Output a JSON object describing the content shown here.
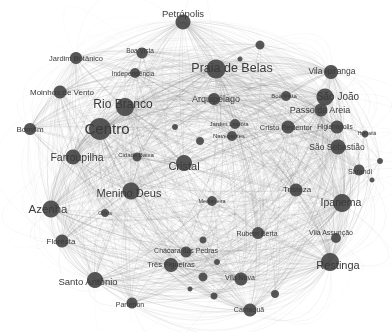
{
  "figure": {
    "title": "",
    "width": 392,
    "height": 332,
    "background_color": "#ffffff"
  },
  "chart_data": {
    "type": "network",
    "title": "",
    "subtitle": "",
    "xlabel": "",
    "ylabel": "",
    "grid": false,
    "legend": "none",
    "layout": "force-directed",
    "node_color": "#4a4a4a",
    "edge_color": "#808080",
    "label_color": "#3a3a3a",
    "node_count": 52,
    "nodes": [
      {
        "id": "petropolis",
        "label": "Petrópolis",
        "x": 183,
        "y": 22,
        "r": 7.5,
        "font": 9.5,
        "lx": 183,
        "ly": 13
      },
      {
        "id": "jardim-botanico",
        "label": "Jardim Botânico",
        "x": 76,
        "y": 58,
        "r": 6.0,
        "font": 7.5,
        "lx": 76,
        "ly": 58
      },
      {
        "id": "boa-vista-n",
        "label": "Boa Vista",
        "x": 142,
        "y": 53,
        "r": 5.5,
        "font": 6.5,
        "lx": 140,
        "ly": 50
      },
      {
        "id": "independencia",
        "label": "Independência",
        "x": 135,
        "y": 73,
        "r": 5.0,
        "font": 6.5,
        "lx": 133,
        "ly": 73
      },
      {
        "id": "praia-de-belas",
        "label": "Praia de Belas",
        "x": 216,
        "y": 69,
        "r": 9.5,
        "font": 12.5,
        "lx": 232,
        "ly": 68
      },
      {
        "id": "vila-ipiranga",
        "label": "Vila Ipiranga",
        "x": 331,
        "y": 72,
        "r": 7.0,
        "font": 8.5,
        "lx": 332,
        "ly": 71
      },
      {
        "id": "moinhos-de-vento",
        "label": "Moinhos de Vento",
        "x": 60,
        "y": 92,
        "r": 6.5,
        "font": 8.0,
        "lx": 62,
        "ly": 92
      },
      {
        "id": "rio-branco",
        "label": "Rio Branco",
        "x": 125,
        "y": 107,
        "r": 9.0,
        "font": 12.0,
        "lx": 123,
        "ly": 104
      },
      {
        "id": "arquipelago",
        "label": "Arquipélago",
        "x": 214,
        "y": 99,
        "r": 6.0,
        "font": 9.0,
        "lx": 216,
        "ly": 99
      },
      {
        "id": "sao-joao",
        "label": "São João",
        "x": 325,
        "y": 97,
        "r": 8.5,
        "font": 10.0,
        "lx": 338,
        "ly": 96
      },
      {
        "id": "boa-vista-e",
        "label": "Boa Vista",
        "x": 286,
        "y": 96,
        "r": 5.0,
        "font": 6.0,
        "lx": 284,
        "ly": 96
      },
      {
        "id": "passo-da-areia",
        "label": "Passo da Areia",
        "x": 321,
        "y": 110,
        "r": 6.5,
        "font": 9.0,
        "lx": 320,
        "ly": 110
      },
      {
        "id": "bomfim",
        "label": "Bomfim",
        "x": 30,
        "y": 129,
        "r": 6.0,
        "font": 8.0,
        "lx": 30,
        "ly": 129
      },
      {
        "id": "centro",
        "label": "Centro",
        "x": 100,
        "y": 129,
        "r": 11.0,
        "font": 15.0,
        "lx": 107,
        "ly": 128
      },
      {
        "id": "jardim-lindoia",
        "label": "Jardim Lindóia",
        "x": 235,
        "y": 124,
        "r": 5.0,
        "font": 6.0,
        "lx": 229,
        "ly": 124
      },
      {
        "id": "cristo-redentor",
        "label": "Cristo Redentor",
        "x": 288,
        "y": 127,
        "r": 6.5,
        "font": 7.5,
        "lx": 286,
        "ly": 127
      },
      {
        "id": "higienopolis",
        "label": "Higienópolis",
        "x": 337,
        "y": 127,
        "r": 6.5,
        "font": 6.5,
        "lx": 335,
        "ly": 126
      },
      {
        "id": "navegantes",
        "label": "Navegantes",
        "x": 232,
        "y": 136,
        "r": 5.0,
        "font": 6.0,
        "lx": 229,
        "ly": 136
      },
      {
        "id": "humaita",
        "label": "Humaitá",
        "x": 365,
        "y": 134,
        "r": 3.5,
        "font": 5.0,
        "lx": 367,
        "ly": 133
      },
      {
        "id": "sao-sebastiao",
        "label": "São Sebastião",
        "x": 338,
        "y": 147,
        "r": 7.5,
        "font": 8.5,
        "lx": 337,
        "ly": 147
      },
      {
        "id": "farroupilha",
        "label": "Farroupilha",
        "x": 73,
        "y": 157,
        "r": 7.5,
        "font": 10.5,
        "lx": 77,
        "ly": 157
      },
      {
        "id": "cidade-baixa",
        "label": "Cidade Baixa",
        "x": 137,
        "y": 157,
        "r": 4.5,
        "font": 6.0,
        "lx": 136,
        "ly": 155
      },
      {
        "id": "cristal",
        "label": "Cristal",
        "x": 184,
        "y": 163,
        "r": 8.0,
        "font": 11.0,
        "lx": 184,
        "ly": 166
      },
      {
        "id": "sarandi",
        "label": "Sarandi",
        "x": 359,
        "y": 170,
        "r": 5.5,
        "font": 7.0,
        "lx": 360,
        "ly": 171
      },
      {
        "id": "menino-deus",
        "label": "Menino Deus",
        "x": 131,
        "y": 191,
        "r": 8.5,
        "font": 11.0,
        "lx": 129,
        "ly": 193
      },
      {
        "id": "tristeza",
        "label": "Tristeza",
        "x": 296,
        "y": 190,
        "r": 6.5,
        "font": 8.0,
        "lx": 297,
        "ly": 189
      },
      {
        "id": "ipanema",
        "label": "Ipanema",
        "x": 342,
        "y": 203,
        "r": 9.0,
        "font": 10.5,
        "lx": 341,
        "ly": 202
      },
      {
        "id": "azenha",
        "label": "Azenha",
        "x": 51,
        "y": 209,
        "r": 8.5,
        "font": 11.5,
        "lx": 48,
        "ly": 209
      },
      {
        "id": "glorinha",
        "label": "Glória",
        "x": 105,
        "y": 213,
        "r": 4.0,
        "font": 5.0,
        "lx": 105,
        "ly": 213
      },
      {
        "id": "medianeira",
        "label": "Medianeira",
        "x": 212,
        "y": 201,
        "r": 5.0,
        "font": 5.5,
        "lx": 212,
        "ly": 201
      },
      {
        "id": "floresta",
        "label": "Floresta",
        "x": 62,
        "y": 241,
        "r": 6.5,
        "font": 8.0,
        "lx": 61,
        "ly": 241
      },
      {
        "id": "rubem-berta",
        "label": "Rubem Berta",
        "x": 258,
        "y": 233,
        "r": 6.0,
        "font": 7.0,
        "lx": 257,
        "ly": 233
      },
      {
        "id": "vila-assuncao",
        "label": "Vila Assunção",
        "x": 336,
        "y": 238,
        "r": 5.0,
        "font": 7.0,
        "lx": 331,
        "ly": 232
      },
      {
        "id": "chacara-das-pedras",
        "label": "Chácara das Pedras",
        "x": 186,
        "y": 252,
        "r": 5.5,
        "font": 7.0,
        "lx": 186,
        "ly": 250
      },
      {
        "id": "tres-figueiras",
        "label": "Três Figueiras",
        "x": 171,
        "y": 265,
        "r": 7.0,
        "font": 7.5,
        "lx": 171,
        "ly": 264
      },
      {
        "id": "restinga",
        "label": "Restinga",
        "x": 330,
        "y": 262,
        "r": 9.0,
        "font": 11.0,
        "lx": 338,
        "ly": 265
      },
      {
        "id": "santo-antonio",
        "label": "Santo Antônio",
        "x": 95,
        "y": 280,
        "r": 8.0,
        "font": 9.5,
        "lx": 88,
        "ly": 281
      },
      {
        "id": "vila-nova",
        "label": "Vila Nova",
        "x": 241,
        "y": 279,
        "r": 6.5,
        "font": 7.0,
        "lx": 240,
        "ly": 277
      },
      {
        "id": "partenon",
        "label": "Partenon",
        "x": 132,
        "y": 303,
        "r": 5.5,
        "font": 7.0,
        "lx": 130,
        "ly": 304
      },
      {
        "id": "camaqua",
        "label": "Camaquã",
        "x": 250,
        "y": 310,
        "r": 6.5,
        "font": 7.0,
        "lx": 249,
        "ly": 309
      },
      {
        "id": "aux-n1",
        "label": "",
        "x": 260,
        "y": 45,
        "r": 4.5,
        "font": 0,
        "lx": 0,
        "ly": 0
      },
      {
        "id": "aux-n2",
        "label": "",
        "x": 240,
        "y": 59,
        "r": 2.5,
        "font": 0,
        "lx": 0,
        "ly": 0
      },
      {
        "id": "aux-n3",
        "label": "",
        "x": 175,
        "y": 127,
        "r": 3.0,
        "font": 0,
        "lx": 0,
        "ly": 0
      },
      {
        "id": "aux-n4",
        "label": "",
        "x": 200,
        "y": 141,
        "r": 4.0,
        "font": 0,
        "lx": 0,
        "ly": 0
      },
      {
        "id": "aux-n5",
        "label": "",
        "x": 380,
        "y": 161,
        "r": 3.0,
        "font": 0,
        "lx": 0,
        "ly": 0
      },
      {
        "id": "aux-n6",
        "label": "",
        "x": 372,
        "y": 180,
        "r": 2.5,
        "font": 0,
        "lx": 0,
        "ly": 0
      },
      {
        "id": "aux-n7",
        "label": "",
        "x": 203,
        "y": 240,
        "r": 3.5,
        "font": 0,
        "lx": 0,
        "ly": 0
      },
      {
        "id": "aux-n8",
        "label": "",
        "x": 217,
        "y": 262,
        "r": 3.0,
        "font": 0,
        "lx": 0,
        "ly": 0
      },
      {
        "id": "aux-n9",
        "label": "",
        "x": 203,
        "y": 277,
        "r": 4.5,
        "font": 0,
        "lx": 0,
        "ly": 0
      },
      {
        "id": "aux-n10",
        "label": "",
        "x": 190,
        "y": 289,
        "r": 2.5,
        "font": 0,
        "lx": 0,
        "ly": 0
      },
      {
        "id": "aux-n11",
        "label": "",
        "x": 214,
        "y": 296,
        "r": 3.5,
        "font": 0,
        "lx": 0,
        "ly": 0
      },
      {
        "id": "aux-n12",
        "label": "",
        "x": 275,
        "y": 294,
        "r": 4.0,
        "font": 0,
        "lx": 0,
        "ly": 0
      }
    ]
  }
}
